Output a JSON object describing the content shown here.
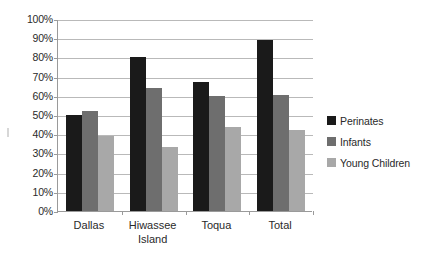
{
  "chart_data": {
    "type": "bar",
    "title": "",
    "subtitle": "",
    "xlabel": "",
    "ylabel": "",
    "categories": [
      "Dallas",
      "Hiwassee Island",
      "Toqua",
      "Total"
    ],
    "category_lines": [
      [
        "Dallas"
      ],
      [
        "Hiwassee",
        "Island"
      ],
      [
        "Toqua"
      ],
      [
        "Total"
      ]
    ],
    "series": [
      {
        "name": "Perinates",
        "color": "#1a1a1a",
        "values": [
          50,
          80,
          67,
          89
        ]
      },
      {
        "name": "Infants",
        "color": "#6e6e6e",
        "values": [
          52,
          64,
          60,
          60.5
        ]
      },
      {
        "name": "Young Children",
        "color": "#a8a8a8",
        "values": [
          39,
          33.5,
          44,
          42
        ]
      }
    ],
    "ylim": [
      0,
      100
    ],
    "ytick_values": [
      0,
      10,
      20,
      30,
      40,
      50,
      60,
      70,
      80,
      90,
      100
    ],
    "ytick_labels": [
      "0%",
      "10%",
      "20%",
      "30%",
      "40%",
      "50%",
      "60%",
      "70%",
      "80%",
      "90%",
      "100%"
    ],
    "ytick_suffix": "%",
    "grid": true,
    "grid_axis": "y",
    "grid_color": "#b9b9b9",
    "axis_color": "#9a9a9a",
    "legend": true,
    "legend_position": "right",
    "legend_entries": [
      "Perinates",
      "Infants",
      "Young Children"
    ],
    "background_color": "#ffffff",
    "text_color": "#2a2a2a"
  }
}
